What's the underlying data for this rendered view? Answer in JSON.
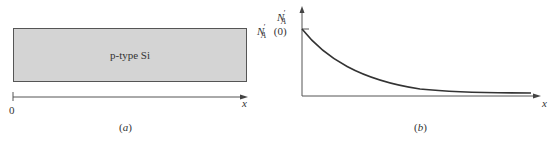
{
  "panel_a": {
    "caption": "(a)",
    "slab_label": "p-type Si",
    "axis_origin_label": "0",
    "axis_label": "x",
    "slab_fill": "#d4d4d4"
  },
  "panel_b": {
    "caption": "(b)",
    "y_axis_label_main": "N",
    "y_axis_label_sub": "A",
    "y_axis_label_prime": "′",
    "y_tick_label_main": "N",
    "y_tick_label_sub": "A",
    "y_tick_label_prime": "′",
    "y_tick_label_arg": " (0)",
    "x_axis_label": "x",
    "curve": "exponential decay from N'_A(0) at x=0 toward zero"
  }
}
